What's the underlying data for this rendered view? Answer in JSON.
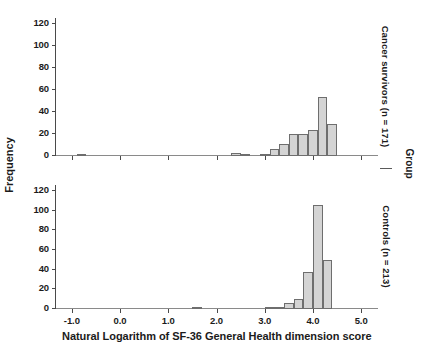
{
  "figure": {
    "xlabel": "Natural Logarithm of SF-36 General Health dimension score",
    "ylabel": "Frequency",
    "group_label": "Group",
    "xticks": [
      "-1.0",
      "0.0",
      "1.0",
      "2.0",
      "3.0",
      "4.0",
      "5.0"
    ],
    "yticks": [
      "0",
      "20",
      "40",
      "60",
      "80",
      "100",
      "120"
    ],
    "bar_fill": "#d4d4d4",
    "bar_edge": "#6e6e6e",
    "axis_color": "#4a4a4a"
  },
  "panels": [
    {
      "id": "cancer-survivors",
      "right_label": "Cancer survivors (n = 171)"
    },
    {
      "id": "controls",
      "right_label": "Controls (n = 213)"
    }
  ],
  "chart_data": [
    {
      "type": "bar",
      "title": "Cancer survivors (n = 171)",
      "xlabel": "Natural Logarithm of SF-36 General Health dimension score",
      "ylabel": "Frequency",
      "xlim": [
        -1.35,
        5.35
      ],
      "ylim": [
        0,
        125
      ],
      "xticks": [
        -1.0,
        0.0,
        1.0,
        2.0,
        3.0,
        4.0,
        5.0
      ],
      "yticks": [
        0,
        20,
        40,
        60,
        80,
        100,
        120
      ],
      "grid": false,
      "legend": "none",
      "bin_width": 0.2,
      "bins": [
        {
          "left": -0.9,
          "right": -0.7,
          "value": 2
        },
        {
          "left": 2.3,
          "right": 2.5,
          "value": 3
        },
        {
          "left": 2.5,
          "right": 2.7,
          "value": 1
        },
        {
          "left": 2.9,
          "right": 3.1,
          "value": 1
        },
        {
          "left": 3.1,
          "right": 3.3,
          "value": 6
        },
        {
          "left": 3.3,
          "right": 3.5,
          "value": 11
        },
        {
          "left": 3.5,
          "right": 3.7,
          "value": 20
        },
        {
          "left": 3.7,
          "right": 3.9,
          "value": 20
        },
        {
          "left": 3.9,
          "right": 4.1,
          "value": 24
        },
        {
          "left": 4.1,
          "right": 4.3,
          "value": 54
        },
        {
          "left": 4.3,
          "right": 4.5,
          "value": 29
        }
      ]
    },
    {
      "type": "bar",
      "title": "Controls (n = 213)",
      "xlabel": "Natural Logarithm of SF-36 General Health dimension score",
      "ylabel": "Frequency",
      "xlim": [
        -1.35,
        5.35
      ],
      "ylim": [
        0,
        125
      ],
      "xticks": [
        -1.0,
        0.0,
        1.0,
        2.0,
        3.0,
        4.0,
        5.0
      ],
      "yticks": [
        0,
        20,
        40,
        60,
        80,
        100,
        120
      ],
      "grid": false,
      "legend": "none",
      "bin_width": 0.2,
      "bins": [
        {
          "left": 1.5,
          "right": 1.7,
          "value": 1
        },
        {
          "left": 3.0,
          "right": 3.2,
          "value": 2
        },
        {
          "left": 3.2,
          "right": 3.4,
          "value": 1
        },
        {
          "left": 3.4,
          "right": 3.6,
          "value": 6
        },
        {
          "left": 3.6,
          "right": 3.8,
          "value": 10
        },
        {
          "left": 3.8,
          "right": 4.0,
          "value": 38
        },
        {
          "left": 4.0,
          "right": 4.2,
          "value": 106
        },
        {
          "left": 4.2,
          "right": 4.4,
          "value": 50
        }
      ]
    }
  ]
}
